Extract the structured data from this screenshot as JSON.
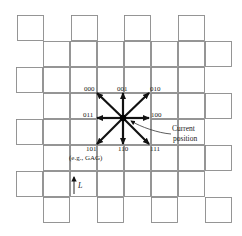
{
  "figure": {
    "grid": {
      "cell_size": 26,
      "stroke_color": "#8a8a8a",
      "rows": [
        {
          "y": 15,
          "xs": [
            17,
            71,
            124,
            178
          ]
        },
        {
          "y": 41,
          "xs": [
            43,
            70,
            97,
            124,
            151,
            178,
            205
          ]
        },
        {
          "y": 67,
          "xs": [
            16,
            43,
            70,
            97,
            124,
            151,
            178
          ]
        },
        {
          "y": 93,
          "xs": [
            43,
            70,
            151,
            178,
            205
          ]
        },
        {
          "y": 119,
          "xs": [
            16,
            43,
            70,
            151,
            178
          ]
        },
        {
          "y": 145,
          "xs": [
            43,
            70,
            97,
            124,
            151,
            178,
            205
          ]
        },
        {
          "y": 171,
          "xs": [
            16,
            43,
            70,
            97,
            124,
            151,
            178
          ]
        },
        {
          "y": 197,
          "xs": [
            43,
            97,
            151,
            205
          ]
        }
      ]
    },
    "center": {
      "x": 123,
      "y": 118
    },
    "directions": [
      {
        "code": "000",
        "dx": -26,
        "dy": -25,
        "label_x": 84,
        "label_y": 91,
        "anchor": "start"
      },
      {
        "code": "001",
        "dx": 0,
        "dy": -25,
        "label_x": 117,
        "label_y": 91,
        "anchor": "start"
      },
      {
        "code": "010",
        "dx": 26,
        "dy": -25,
        "label_x": 150,
        "label_y": 91,
        "anchor": "start"
      },
      {
        "code": "011",
        "dx": -26,
        "dy": 0,
        "label_x": 83,
        "label_y": 117,
        "anchor": "start"
      },
      {
        "code": "100",
        "dx": 26,
        "dy": 0,
        "label_x": 151,
        "label_y": 117,
        "anchor": "start"
      },
      {
        "code": "101",
        "dx": -26,
        "dy": 26,
        "label_x": 86,
        "label_y": 151,
        "anchor": "start"
      },
      {
        "code": "110",
        "dx": 0,
        "dy": 26,
        "label_x": 118,
        "label_y": 151,
        "anchor": "start"
      },
      {
        "code": "111",
        "dx": 26,
        "dy": 26,
        "label_x": 150,
        "label_y": 151,
        "anchor": "start"
      }
    ],
    "example_label": "(e.g., GAG)",
    "current_position_label": [
      "Current",
      "position"
    ],
    "length_label": "L"
  }
}
